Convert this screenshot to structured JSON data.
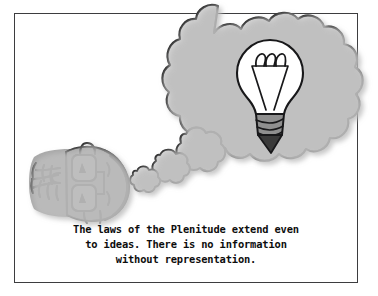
{
  "panel": {
    "title": "thought-bubble-cartoon",
    "background_color": "#ffffff",
    "border_color": "#3d3d3f"
  },
  "caption": {
    "text": "The laws of the Plenitude extend even\nto ideas. There is no information\nwithout representation.",
    "line_1": "The laws of the Plenitude extend even",
    "line_2": "to ideas. There is no information",
    "line_3": "without representation."
  },
  "artwork": {
    "character": {
      "name": "bespectacled-head",
      "description": "side-view cartoon head with glasses and spiky hair",
      "fill_color": "#a8a8a8",
      "ink_color": "#1a1a1a"
    },
    "thought_bubble": {
      "name": "thought-cloud",
      "fill_color": "#d4d4d4",
      "ink_color": "#1a1a1a",
      "trailing_bubbles": 3
    },
    "lightbulb": {
      "name": "idea-lightbulb",
      "glass_color": "#ffffff",
      "screw_base_color": "#8f8f8f",
      "tip_color": "#3a3a3a",
      "filament_loops": 3
    }
  }
}
